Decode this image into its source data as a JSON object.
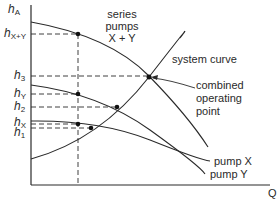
{
  "diagram": {
    "axes": {
      "y_label_base": "h",
      "y_label_sub": "A",
      "x_label": "Q"
    },
    "y_ticks": [
      {
        "base": "h",
        "sub": "X+Y"
      },
      {
        "base": "h",
        "sub": "3"
      },
      {
        "base": "h",
        "sub": "Y"
      },
      {
        "base": "h",
        "sub": "2"
      },
      {
        "base": "h",
        "sub": "X"
      },
      {
        "base": "h",
        "sub": "1"
      }
    ],
    "labels": {
      "series_line1": "series",
      "series_line2": "pumps",
      "series_line3": "X + Y",
      "system_curve": "system curve",
      "combined_line1": "combined",
      "combined_line2": "operating",
      "combined_line3": "point",
      "pump_x": "pump X",
      "pump_y": "pump Y"
    },
    "colors": {
      "line": "#2a2a2a",
      "background": "#ffffff"
    }
  }
}
